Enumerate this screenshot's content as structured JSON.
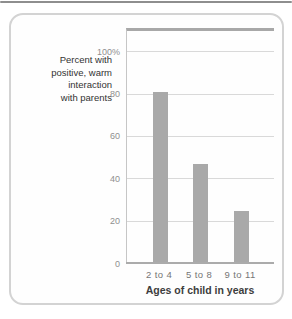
{
  "page": {
    "background": "#ffffff",
    "top_rule_color": "#8e8e8e"
  },
  "card": {
    "background": "#fefefe",
    "border_color": "#d3d3d3"
  },
  "chart_data": {
    "type": "bar",
    "title": "",
    "ylabel": "Percent with positive, warm interaction with parents",
    "ylabel_lines": [
      "Percent with",
      "positive, warm",
      "interaction",
      "with parents"
    ],
    "xlabel": "Ages of child in years",
    "categories": [
      "2 to 4",
      "5 to 8",
      "9 to 11"
    ],
    "values": [
      81,
      47,
      25
    ],
    "yticks": [
      {
        "value": 100,
        "label": "100%"
      },
      {
        "value": 80,
        "label": "80"
      },
      {
        "value": 60,
        "label": "60"
      },
      {
        "value": 40,
        "label": "40"
      },
      {
        "value": 20,
        "label": "20"
      },
      {
        "value": 0,
        "label": "0"
      }
    ],
    "ylim": [
      0,
      110
    ],
    "grid": true,
    "legend_position": "none",
    "bar_color": "#a9a9a9",
    "gridline_color": "#d9d9d9",
    "axis_color": "#ababab",
    "plot_top_border_color": "#a8a8a8",
    "plot_left_border_color": "#c6c6c6"
  }
}
